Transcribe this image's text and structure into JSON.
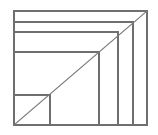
{
  "figure": {
    "title": "Nested rectangles with diagonal",
    "type": "line-diagram",
    "canvas": {
      "width": 158,
      "height": 135
    },
    "colors": {
      "background": "#ffffff",
      "stroke": "#6f6f6f",
      "diagonal_stroke": "#7a7a7a"
    },
    "outer_rect": {
      "label": "outer rectangle",
      "x": 14,
      "y": 11,
      "width": 133,
      "height": 114
    },
    "diagonal": {
      "label": "diagonal from bottom-left to top-right",
      "x1": 14,
      "y1": 125,
      "x2": 147,
      "y2": 11
    },
    "horizontal_lines": [
      {
        "label": "horizontal divider 1",
        "x1": 14,
        "y": 22,
        "x2": 133
      },
      {
        "label": "horizontal divider 2",
        "x1": 14,
        "y": 32,
        "x2": 118
      },
      {
        "label": "horizontal divider 3",
        "x1": 14,
        "y": 52,
        "x2": 99
      },
      {
        "label": "horizontal divider 4",
        "x1": 14,
        "y": 95,
        "x2": 50
      }
    ],
    "vertical_lines": [
      {
        "label": "vertical divider 1",
        "x": 133,
        "y1": 22,
        "y2": 125
      },
      {
        "label": "vertical divider 2",
        "x": 118,
        "y1": 32,
        "y2": 125
      },
      {
        "label": "vertical divider 3",
        "x": 99,
        "y1": 52,
        "y2": 125
      },
      {
        "label": "vertical divider 4",
        "x": 50,
        "y1": 95,
        "y2": 125
      }
    ]
  }
}
